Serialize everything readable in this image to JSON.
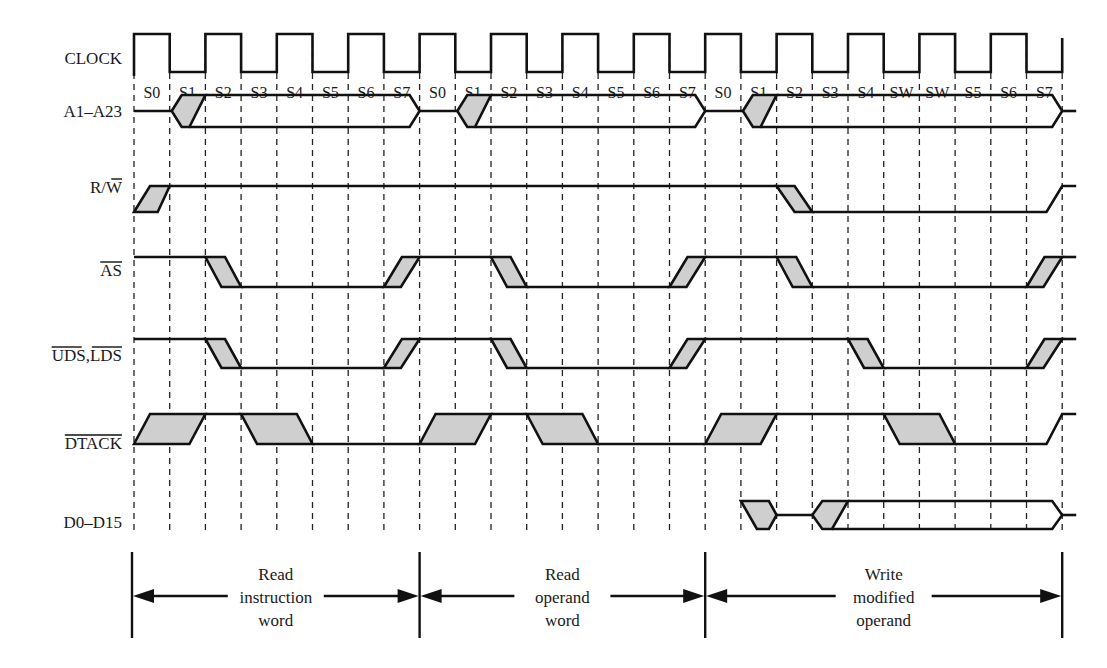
{
  "diagram": {
    "shade_color": "#cfcfcf",
    "line_color": "#111111",
    "signals": [
      {
        "id": "clock",
        "label": "CLOCK",
        "overbar": ""
      },
      {
        "id": "addr",
        "label": "A1–A23",
        "overbar": ""
      },
      {
        "id": "rw",
        "label": "R/W",
        "overbar": "W"
      },
      {
        "id": "as",
        "label": "AS",
        "overbar": "AS"
      },
      {
        "id": "uds",
        "label": "UDS,LDS",
        "overbar": "UDS,LDS"
      },
      {
        "id": "dtack",
        "label": "DTACK",
        "overbar": "DTACK"
      },
      {
        "id": "data",
        "label": "D0–D15",
        "overbar": ""
      }
    ],
    "states": [
      "S0",
      "S1",
      "S2",
      "S3",
      "S4",
      "S5",
      "S6",
      "S7",
      "S0",
      "S1",
      "S2",
      "S3",
      "S4",
      "S5",
      "S6",
      "S7",
      "S0",
      "S1",
      "S2",
      "S3",
      "S4",
      "SW",
      "SW",
      "S5",
      "S6",
      "S7"
    ],
    "phases": [
      {
        "id": "read-instruction",
        "lines": [
          "Read",
          "instruction",
          "word"
        ]
      },
      {
        "id": "read-operand",
        "lines": [
          "Read",
          "operand",
          "word"
        ]
      },
      {
        "id": "write-operand",
        "lines": [
          "Write",
          "modified",
          "operand"
        ]
      }
    ]
  }
}
